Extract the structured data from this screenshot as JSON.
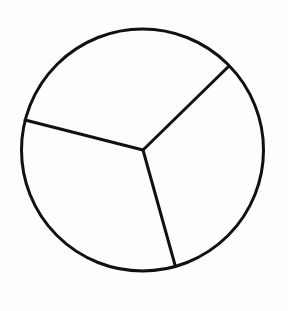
{
  "diagram": {
    "type": "circle-divided-into-sectors",
    "stroke_color": "#111111",
    "background_color": "#fdfdfd",
    "circle": {
      "cx": 142.5,
      "cy": 150,
      "r": 121
    },
    "center_point": {
      "x": 143,
      "y": 150
    },
    "radii_endpoints": [
      {
        "x": 228,
        "y": 67
      },
      {
        "x": 25,
        "y": 120
      },
      {
        "x": 175,
        "y": 265
      }
    ],
    "sector_count": 3,
    "sector_angles_deg_approx": [
      119,
      120,
      121
    ],
    "labels": []
  }
}
